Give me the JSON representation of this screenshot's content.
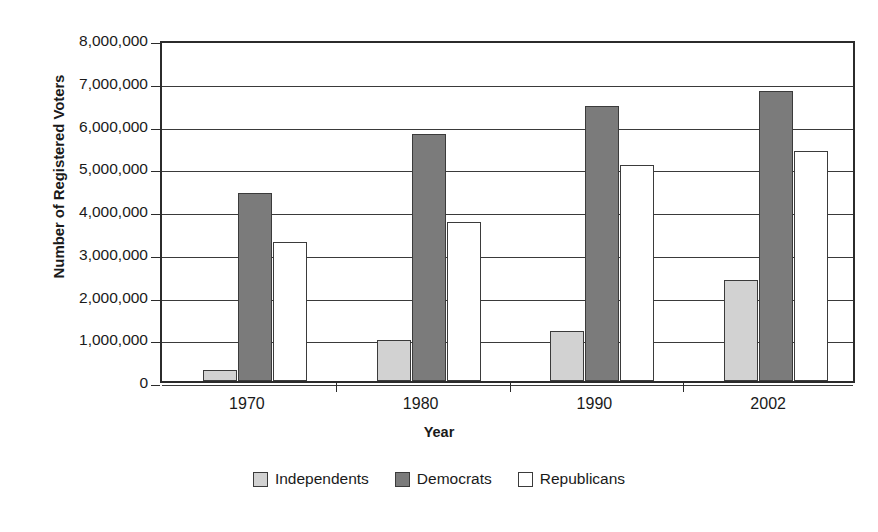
{
  "chart_data": {
    "type": "bar",
    "title": "",
    "xlabel": "Year",
    "ylabel": "Number of Registered Voters",
    "categories": [
      "1970",
      "1980",
      "1990",
      "2002"
    ],
    "series": [
      {
        "name": "Independents",
        "color": "#d2d2d2",
        "values": [
          260000,
          960000,
          1170000,
          2370000
        ]
      },
      {
        "name": "Democrats",
        "color": "#7b7b7b",
        "values": [
          4400000,
          5780000,
          6430000,
          6790000
        ]
      },
      {
        "name": "Republicans",
        "color": "#ffffff",
        "values": [
          3250000,
          3730000,
          5050000,
          5380000
        ]
      }
    ],
    "ylim": [
      0,
      8000000
    ],
    "ytick_values": [
      8000000,
      7000000,
      6000000,
      5000000,
      4000000,
      3000000,
      2000000,
      1000000,
      0
    ],
    "ytick_labels": [
      "8,000,000",
      "7,000,000",
      "6,000,000",
      "5,000,000",
      "4,000,000",
      "3,000,000",
      "2,000,000",
      "1,000,000",
      "0"
    ],
    "grid": true,
    "legend_position": "bottom",
    "axis_color": "#2b2b2b",
    "bar_border_color": "#3b3b3b"
  }
}
